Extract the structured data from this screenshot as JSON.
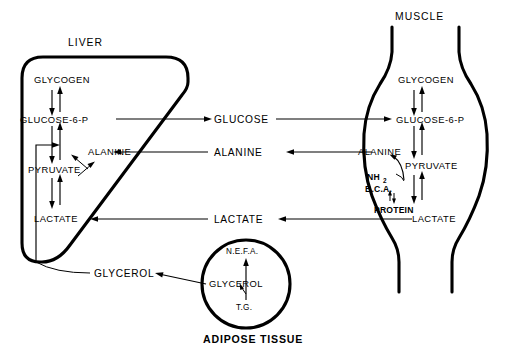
{
  "diagram": {
    "title_visible": false,
    "organs": [
      {
        "id": "liver",
        "label": "LIVER"
      },
      {
        "id": "muscle",
        "label": "MUSCLE"
      },
      {
        "id": "adipose",
        "label": "ADIPOSE TISSUE"
      }
    ],
    "liver": {
      "label": "LIVER",
      "metabolites": {
        "glycogen": "GLYCOGEN",
        "glucose_6_p": "GLUCOSE-6-P",
        "alanine": "ALANINE",
        "pyruvate": "PYRUVATE",
        "lactate": "LACTATE"
      }
    },
    "muscle": {
      "label": "MUSCLE",
      "metabolites": {
        "glycogen": "GLYCOGEN",
        "glucose_6_p": "GLUCOSE-6-P",
        "alanine": "ALANINE",
        "pyruvate": "PYRUVATE",
        "lactate": "LACTATE",
        "protein": "PROTEIN",
        "bca": "B.C.A.",
        "nh2": "NH",
        "nh2_sub": "2"
      }
    },
    "adipose": {
      "label": "ADIPOSE TISSUE",
      "metabolites": {
        "nefa": "N.E.F.A.",
        "glycerol": "GLYCEROL",
        "tg": "T.G."
      }
    },
    "transport": {
      "glucose": "GLUCOSE",
      "alanine": "ALANINE",
      "lactate": "LACTATE",
      "glycerol": "GLYCEROL"
    },
    "colors": {
      "ink": "#000000",
      "background": "#ffffff"
    }
  }
}
